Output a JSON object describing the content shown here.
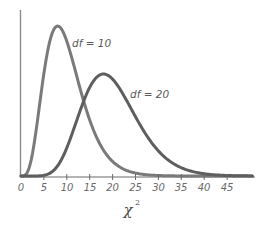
{
  "chart_data": {
    "type": "line",
    "title": "",
    "xlabel": "χ²",
    "ylabel": "",
    "xlim": [
      0,
      50
    ],
    "grid": false,
    "x_ticks": [
      0,
      5,
      10,
      15,
      20,
      25,
      30,
      35,
      40,
      45
    ],
    "x_tick_labels": [
      "0",
      "5",
      "10",
      "15",
      "20",
      "25",
      "30",
      "35",
      "40",
      "45"
    ],
    "series": [
      {
        "name": "df = 10",
        "df": 10,
        "mode": 8,
        "color": "#7a7a7a"
      },
      {
        "name": "df = 20",
        "df": 20,
        "mode": 18,
        "color": "#5e5e5e"
      }
    ],
    "annotations": [
      {
        "text": "df = 10",
        "near_x": 11,
        "series": "df = 10"
      },
      {
        "text": "df = 20",
        "near_x": 24,
        "series": "df = 20"
      }
    ]
  },
  "labels": {
    "curve_1": "df = 10",
    "curve_2": "df = 20",
    "x_axis_title": "χ",
    "x_axis_title_sup": "2",
    "ticks": [
      "0",
      "5",
      "10",
      "15",
      "20",
      "25",
      "30",
      "35",
      "40",
      "45"
    ]
  }
}
